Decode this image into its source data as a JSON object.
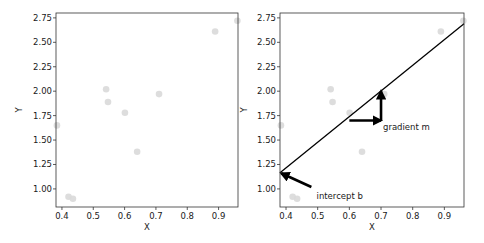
{
  "chart_data": [
    {
      "type": "scatter",
      "title": "",
      "xlabel": "X",
      "ylabel": "Y",
      "xlim": [
        0.381,
        0.962
      ],
      "ylim": [
        0.815,
        2.8
      ],
      "grid": false,
      "xticks": [
        0.4,
        0.5,
        0.6,
        0.7,
        0.8,
        0.9
      ],
      "xtick_labels": [
        "0.4",
        "0.5",
        "0.6",
        "0.7",
        "0.8",
        "0.9"
      ],
      "yticks": [
        1.0,
        1.25,
        1.5,
        1.75,
        2.0,
        2.25,
        2.5,
        2.75
      ],
      "ytick_labels": [
        "1.00",
        "1.25",
        "1.50",
        "1.75",
        "2.00",
        "2.25",
        "2.50",
        "2.75"
      ],
      "point_color": "#d9d9d9",
      "series": [
        {
          "name": "data",
          "points": [
            {
              "x": 0.384,
              "y": 1.65
            },
            {
              "x": 0.421,
              "y": 0.92
            },
            {
              "x": 0.435,
              "y": 0.9
            },
            {
              "x": 0.541,
              "y": 2.02
            },
            {
              "x": 0.547,
              "y": 1.89
            },
            {
              "x": 0.601,
              "y": 1.78
            },
            {
              "x": 0.64,
              "y": 1.38
            },
            {
              "x": 0.71,
              "y": 1.97
            },
            {
              "x": 0.889,
              "y": 2.61
            },
            {
              "x": 0.96,
              "y": 2.72
            }
          ]
        }
      ]
    },
    {
      "type": "scatter",
      "title": "",
      "xlabel": "X",
      "ylabel": "Y",
      "xlim": [
        0.381,
        0.962
      ],
      "ylim": [
        0.815,
        2.8
      ],
      "grid": false,
      "xticks": [
        0.4,
        0.5,
        0.6,
        0.7,
        0.8,
        0.9
      ],
      "xtick_labels": [
        "0.4",
        "0.5",
        "0.6",
        "0.7",
        "0.8",
        "0.9"
      ],
      "yticks": [
        1.0,
        1.25,
        1.5,
        1.75,
        2.0,
        2.25,
        2.5,
        2.75
      ],
      "ytick_labels": [
        "1.00",
        "1.25",
        "1.50",
        "1.75",
        "2.00",
        "2.25",
        "2.50",
        "2.75"
      ],
      "point_color": "#d9d9d9",
      "series": [
        {
          "name": "data",
          "points": [
            {
              "x": 0.384,
              "y": 1.65
            },
            {
              "x": 0.421,
              "y": 0.92
            },
            {
              "x": 0.435,
              "y": 0.9
            },
            {
              "x": 0.541,
              "y": 2.02
            },
            {
              "x": 0.547,
              "y": 1.89
            },
            {
              "x": 0.601,
              "y": 1.78
            },
            {
              "x": 0.64,
              "y": 1.38
            },
            {
              "x": 0.71,
              "y": 1.97
            },
            {
              "x": 0.889,
              "y": 2.61
            },
            {
              "x": 0.96,
              "y": 2.72
            }
          ]
        }
      ],
      "fit_line": {
        "slope": 2.63,
        "intercept": 0.163,
        "x_start": 0.381,
        "y_start": 1.165,
        "x_end": 0.962,
        "y_end": 2.69,
        "color": "#000000"
      },
      "annotations": [
        {
          "text": "intercept b",
          "text_x": 0.49,
          "text_y": 0.94,
          "arrow_to": {
            "x": 0.385,
            "y": 1.16
          },
          "arrow_from": {
            "x": 0.48,
            "y": 1.02
          }
        },
        {
          "text": "gradient m",
          "text_x": 0.7,
          "text_y": 1.64,
          "arrow_from": {
            "x": 0.6,
            "y": 1.7
          },
          "arrow_to": {
            "x": 0.7,
            "y": 1.7
          }
        },
        {
          "text": "",
          "arrow_from": {
            "x": 0.7,
            "y": 1.7
          },
          "arrow_to": {
            "x": 0.7,
            "y": 2.0
          }
        }
      ]
    }
  ]
}
